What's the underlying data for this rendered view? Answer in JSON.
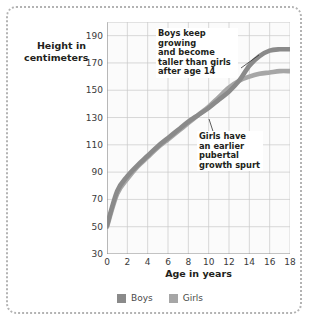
{
  "chart_data": {
    "type": "line",
    "title": "",
    "xlabel": "Age in years",
    "ylabel": "Height in centimeters",
    "xlim": [
      0,
      18
    ],
    "ylim": [
      30,
      200
    ],
    "grid": true,
    "xticks": [
      0,
      2,
      4,
      6,
      8,
      10,
      12,
      14,
      16,
      18
    ],
    "yticks": [
      30,
      50,
      70,
      90,
      110,
      130,
      150,
      170,
      190
    ],
    "legend_position": "bottom",
    "x": [
      0,
      1,
      2,
      3,
      4,
      5,
      6,
      7,
      8,
      9,
      10,
      11,
      12,
      13,
      14,
      15,
      16,
      17,
      18
    ],
    "series": [
      {
        "name": "Boys",
        "color": "#8a8a8a",
        "values": [
          51,
          76,
          87,
          95,
          102,
          109,
          115,
          121,
          127,
          132,
          137,
          143,
          149,
          157,
          168,
          175,
          179,
          180,
          180
        ]
      },
      {
        "name": "Girls",
        "color": "#a6a6a6",
        "values": [
          50,
          74,
          85,
          94,
          101,
          108,
          114,
          120,
          126,
          132,
          138,
          145,
          152,
          157,
          160,
          162,
          163,
          164,
          164
        ]
      }
    ],
    "annotations": [
      {
        "id": "boys-note",
        "text": "Boys keep growing\nand become\ntaller than girls\nafter age 14",
        "points_to_series": "Boys",
        "points_to_x": 15
      },
      {
        "id": "girls-note",
        "text": "Girls have\nan earlier\npubertal\ngrowth spurt",
        "points_to_series": "Girls",
        "points_to_x": 12.4
      }
    ]
  },
  "axes": {
    "y_title_line1": "Height in",
    "y_title_line2": "centimeters",
    "x_title": "Age in years",
    "y_tick_labels": [
      "190",
      "170",
      "150",
      "130",
      "110",
      "90",
      "70",
      "50",
      "30"
    ],
    "x_tick_labels": [
      "0",
      "2",
      "4",
      "6",
      "8",
      "10",
      "12",
      "14",
      "16",
      "18"
    ]
  },
  "annotations": {
    "boys_note": "Boys keep growing\nand become\ntaller than girls\nafter age 14",
    "girls_note": "Girls have\nan earlier\npubertal\ngrowth spurt"
  },
  "legend": {
    "items": [
      {
        "label": "Boys",
        "color": "#8a8a8a"
      },
      {
        "label": "Girls",
        "color": "#a6a6a6"
      }
    ]
  },
  "colors": {
    "boys_line": "#8a8a8a",
    "girls_line": "#adadad",
    "grid": "#c9c9c9",
    "plot_bg": "#fbfbfb",
    "frame": "#b3b3b3",
    "text": "#231f20"
  }
}
